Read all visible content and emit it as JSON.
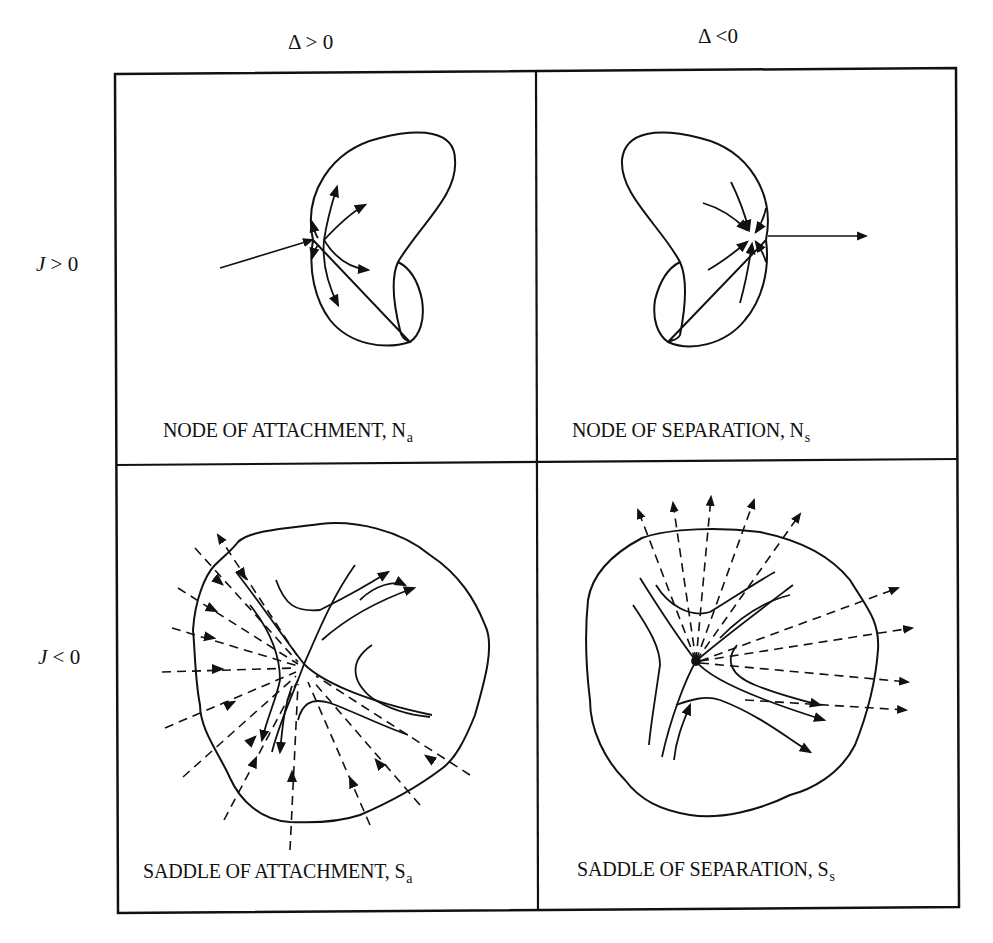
{
  "figure": {
    "column_headers": [
      {
        "symbol": "Δ",
        "relation": ">",
        "value": "0",
        "text": "Δ > 0"
      },
      {
        "symbol": "Δ",
        "relation": "<",
        "value": "0",
        "text": "Δ <0"
      }
    ],
    "row_headers": [
      {
        "symbol": "J",
        "rest": " > 0"
      },
      {
        "symbol": "J",
        "rest": " < 0"
      }
    ],
    "cells": [
      {
        "label": "NODE OF ATTACHMENT, N",
        "sub": "a",
        "row": 0,
        "col": 0
      },
      {
        "label": "NODE OF SEPARATION, N",
        "sub": "s",
        "row": 0,
        "col": 1
      },
      {
        "label": "SADDLE OF ATTACHMENT, S",
        "sub": "a",
        "row": 1,
        "col": 0
      },
      {
        "label": "SADDLE OF SEPARATION, S",
        "sub": "s",
        "row": 1,
        "col": 1
      }
    ],
    "line_color": "#111111",
    "background": "#ffffff"
  }
}
